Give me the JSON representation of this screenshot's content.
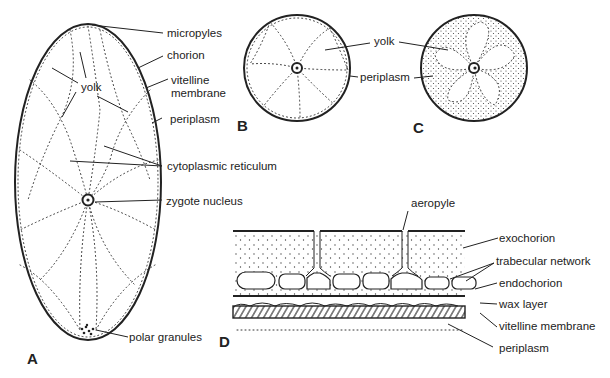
{
  "figure": {
    "panels": {
      "A": {
        "label": "A",
        "title": "Egg longitudinal section",
        "labels": {
          "micropyles": "micropyles",
          "chorion": "chorion",
          "vitelline_membrane_1": "vitelline",
          "vitelline_membrane_2": "membrane",
          "periplasm": "periplasm",
          "yolk": "yolk",
          "cytoplasmic_reticulum": "cytoplasmic reticulum",
          "zygote_nucleus": "zygote nucleus",
          "polar_granules": "polar granules"
        }
      },
      "B": {
        "label": "B",
        "labels": {
          "yolk": "yolk",
          "periplasm": "periplasm"
        }
      },
      "C": {
        "label": "C"
      },
      "D": {
        "label": "D",
        "labels": {
          "aeropyle": "aeropyle",
          "exochorion": "exochorion",
          "trabecular_network": "trabecular network",
          "endochorion": "endochorion",
          "wax_layer": "wax layer",
          "vitelline_membrane": "vitelline membrane",
          "periplasm": "periplasm"
        }
      }
    }
  }
}
